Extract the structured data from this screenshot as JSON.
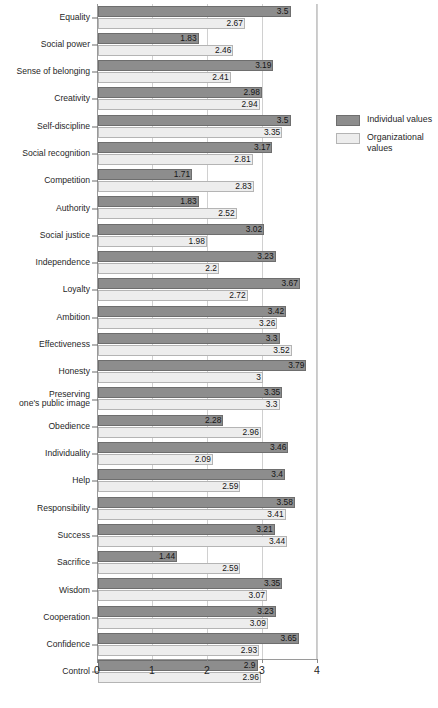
{
  "chart_data": {
    "type": "bar",
    "orientation": "horizontal",
    "title": "",
    "subtitle": "",
    "xlabel": "",
    "ylabel": "",
    "xlim": [
      0,
      4
    ],
    "xticks": [
      0,
      1,
      2,
      3,
      4
    ],
    "xtick_labels": [
      "0",
      "1",
      "2",
      "3",
      "4"
    ],
    "grid": true,
    "grid_axis": "x",
    "legend_position": "right",
    "categories": [
      "Equality",
      "Social power",
      "Sense of belonging",
      "Creativity",
      "Self-discipline",
      "Social recognition",
      "Competition",
      "Authority",
      "Social justice",
      "Independence",
      "Loyalty",
      "Ambition",
      "Effectiveness",
      "Honesty",
      "Preserving\none's public image",
      "Obedience",
      "Individuality",
      "Help",
      "Responsibility",
      "Success",
      "Sacrifice",
      "Wisdom",
      "Cooperation",
      "Confidence",
      "Control"
    ],
    "series": [
      {
        "name": "Individual values",
        "color": "#8d8d8d",
        "border_color": "#6e6e6e",
        "values": [
          3.5,
          1.83,
          3.19,
          2.98,
          3.5,
          3.17,
          1.71,
          1.83,
          3.02,
          3.23,
          3.67,
          3.42,
          3.3,
          3.79,
          3.35,
          2.28,
          3.46,
          3.4,
          3.58,
          3.21,
          1.44,
          3.35,
          3.23,
          3.65,
          2.9
        ],
        "value_labels": [
          "3.5",
          "1.83",
          "3.19",
          "2.98",
          "3.5",
          "3.17",
          "1.71",
          "1.83",
          "3.02",
          "3.23",
          "3.67",
          "3.42",
          "3.3",
          "3.79",
          "3.35",
          "2.28",
          "3.46",
          "3.4",
          "3.58",
          "3.21",
          "1.44",
          "3.35",
          "3.23",
          "3.65",
          "2.9"
        ]
      },
      {
        "name": "Organizational values",
        "color": "#ededed",
        "border_color": "#b4b4b4",
        "values": [
          2.67,
          2.46,
          2.41,
          2.94,
          3.35,
          2.81,
          2.83,
          2.52,
          1.98,
          2.2,
          2.72,
          3.26,
          3.52,
          3.0,
          3.3,
          2.96,
          2.09,
          2.59,
          3.41,
          3.44,
          2.59,
          3.07,
          3.09,
          2.93,
          2.96
        ],
        "value_labels": [
          "2.67",
          "2.46",
          "2.41",
          "2.94",
          "3.35",
          "2.81",
          "2.83",
          "2.52",
          "1.98",
          "2.2",
          "2.72",
          "3.26",
          "3.52",
          "3",
          "3.3",
          "2.96",
          "2.09",
          "2.59",
          "3.41",
          "3.44",
          "2.59",
          "3.07",
          "3.09",
          "2.93",
          "2.96"
        ]
      }
    ]
  },
  "legend": {
    "items": [
      {
        "label": "Individual values",
        "key": "individual"
      },
      {
        "label": "Organizational values",
        "key": "organizational"
      }
    ]
  },
  "colors": {
    "individual_fill": "#8d8d8d",
    "individual_border": "#6e6e6e",
    "organizational_fill": "#ededed",
    "organizational_border": "#b4b4b4",
    "gridline": "#d0d0d0",
    "axis": "#9a9a9a",
    "text": "#1f1f1f",
    "background": "#ffffff"
  }
}
